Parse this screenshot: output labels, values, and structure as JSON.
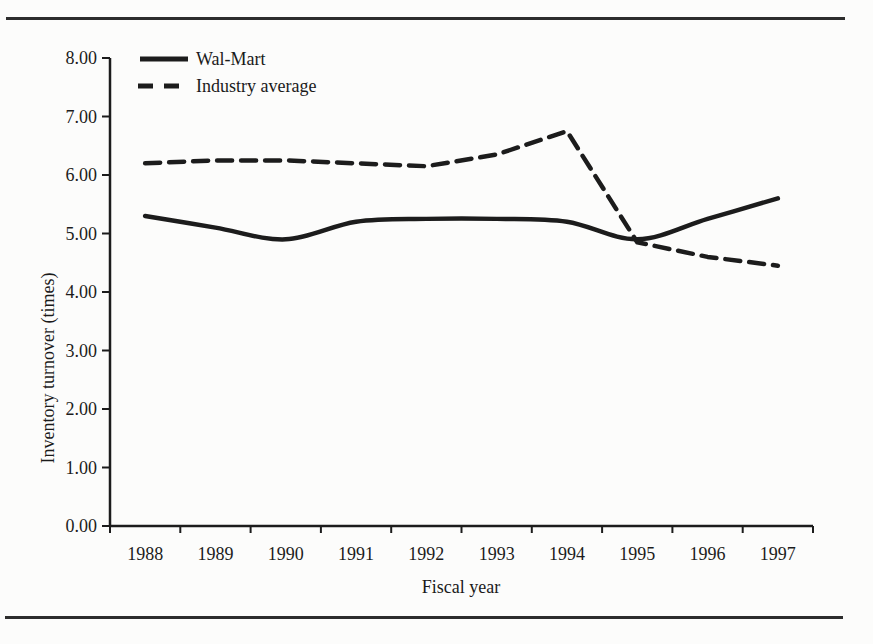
{
  "figure": {
    "background": "#fcfcfb",
    "ink": "#1c1c1c",
    "rule_color": "#2d2d2d"
  },
  "chart_data": {
    "type": "line",
    "title": "",
    "xlabel": "Fiscal year",
    "ylabel": "Inventory turnover (times)",
    "categories": [
      "1988",
      "1989",
      "1990",
      "1991",
      "1992",
      "1993",
      "1994",
      "1995",
      "1996",
      "1997"
    ],
    "y_axis": {
      "min": 0,
      "max": 8,
      "tick_step": 1,
      "tick_labels": [
        "0.00",
        "1.00",
        "2.00",
        "3.00",
        "4.00",
        "5.00",
        "6.00",
        "7.00",
        "8.00"
      ]
    },
    "grid": false,
    "legend_position": "top-left-inside",
    "series": [
      {
        "name": "Wal-Mart",
        "style": "solid",
        "smooth": true,
        "color": "#1c1c1c",
        "values": [
          5.3,
          5.1,
          4.9,
          5.2,
          5.25,
          5.25,
          5.2,
          4.9,
          5.25,
          5.6
        ]
      },
      {
        "name": "Industry average",
        "style": "dashed",
        "smooth": false,
        "color": "#1c1c1c",
        "values": [
          6.2,
          6.25,
          6.25,
          6.2,
          6.15,
          6.35,
          6.75,
          4.85,
          4.6,
          4.45
        ]
      }
    ]
  }
}
